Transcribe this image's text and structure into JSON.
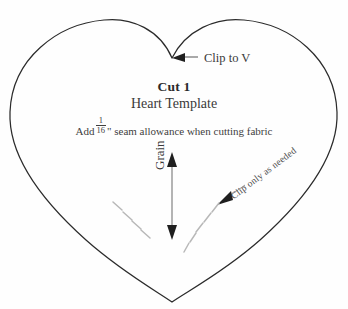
{
  "page": {
    "background_color": "#fefefe",
    "ink_color": "#2b2b2b",
    "text_color": "#3a3a3a"
  },
  "template": {
    "shape_name": "heart",
    "cut_count_label": "Cut 1",
    "title": "Heart Template",
    "seam_note_prefix": "Add",
    "seam_fraction_numerator": "1",
    "seam_fraction_denominator": "16",
    "seam_note_suffix": "\" seam allowance when cutting fabric"
  },
  "annotations": {
    "clip_to_v": {
      "label": "Clip to V",
      "arrow": "arrow-left",
      "target": "heart-top-notch"
    },
    "grain": {
      "label": "Grain",
      "arrow": "double-headed-vertical-arrow",
      "orientation": "vertical"
    },
    "clip_only_as_needed": {
      "label": "Clip only as needed",
      "arrow": "arrow-down-left",
      "target": "heart-lower-right-edge"
    }
  },
  "clip_marks": {
    "left_edge_count": 4,
    "right_edge_count": 5,
    "style": "short-dash"
  }
}
